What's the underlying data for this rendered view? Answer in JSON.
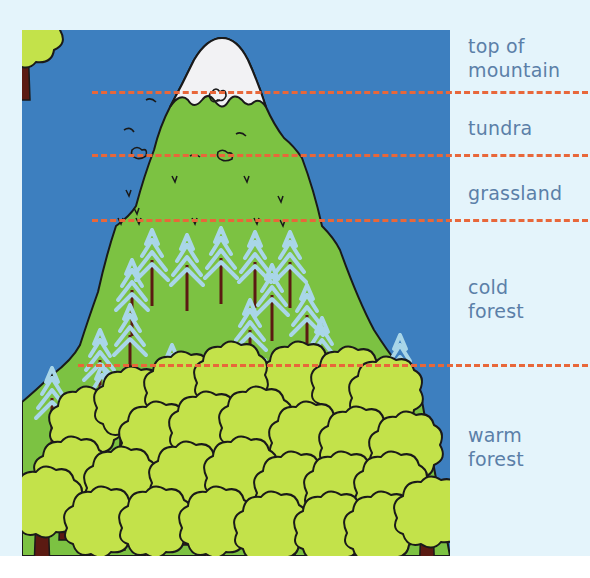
{
  "diagram": {
    "colors": {
      "background": "#e4f4fb",
      "sky": "#3d7fbf",
      "mountain_green": "#7cc242",
      "snow": "#f2f2f4",
      "divider": "#e8673a",
      "label_text": "#5b7fa8",
      "conifer": "#a9d6e8",
      "deciduous_canopy": "#c3e24a",
      "trunk": "#5b1a12"
    },
    "zones": [
      {
        "id": "top",
        "label": "top of\nmountain"
      },
      {
        "id": "tundra",
        "label": "tundra"
      },
      {
        "id": "grassland",
        "label": "grassland"
      },
      {
        "id": "cold-forest",
        "label": "cold\nforest"
      },
      {
        "id": "warm-forest",
        "label": "warm\nforest"
      }
    ],
    "dividers": [
      {
        "between": "top / tundra",
        "y": 92
      },
      {
        "between": "tundra / grassland",
        "y": 155
      },
      {
        "between": "grassland / cold forest",
        "y": 220
      },
      {
        "between": "cold forest / warm forest",
        "y": 365
      }
    ]
  }
}
